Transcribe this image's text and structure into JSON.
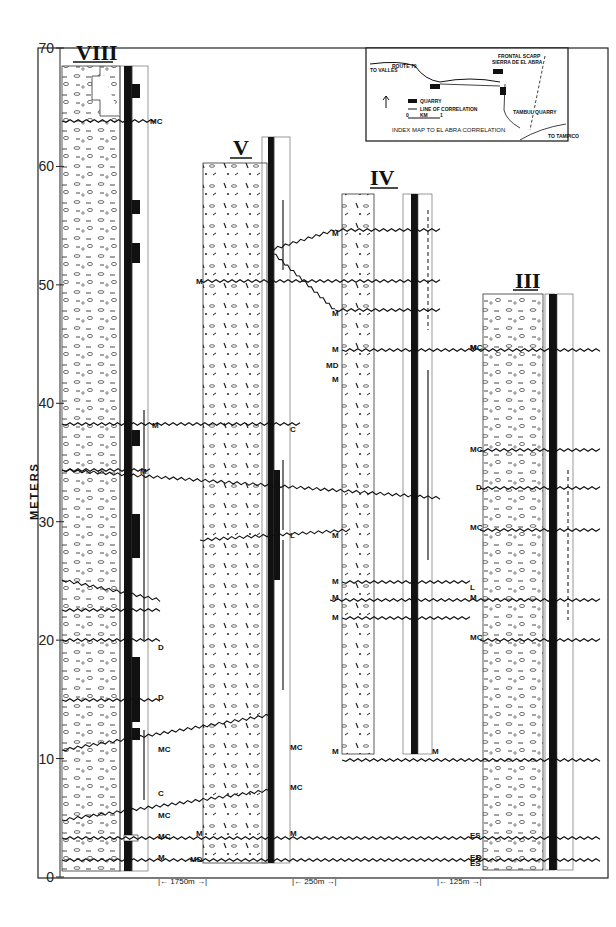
{
  "figure": {
    "y_axis": {
      "label": "METERS",
      "ticks": [
        0,
        10,
        20,
        30,
        40,
        50,
        60,
        70
      ],
      "range": [
        0,
        70
      ]
    },
    "columns": [
      {
        "id": "VIII",
        "label": "VIII",
        "top_m": 68
      },
      {
        "id": "V",
        "label": "V",
        "top_m": 60
      },
      {
        "id": "IV",
        "label": "IV",
        "top_m": 55
      },
      {
        "id": "III",
        "label": "III",
        "top_m": 49
      }
    ],
    "spacings": [
      {
        "label": "1750m",
        "between": [
          "VIII",
          "V"
        ]
      },
      {
        "label": "250m",
        "between": [
          "V",
          "IV"
        ]
      },
      {
        "label": "125m",
        "between": [
          "IV",
          "III"
        ]
      }
    ],
    "horizon_labels": {
      "VIII": [
        "MC",
        "M",
        "M",
        "D",
        "D",
        "MC",
        "C",
        "MC",
        "MC",
        "M"
      ],
      "V": [
        "M",
        "C",
        "L",
        "MC",
        "MC",
        "M",
        "M",
        "MD"
      ],
      "IV": [
        "M",
        "M",
        "M",
        "MD",
        "M",
        "M",
        "M",
        "M",
        "M",
        "M",
        "M"
      ],
      "III": [
        "MC",
        "M",
        "MC",
        "D",
        "MC",
        "MC",
        "M",
        "L",
        "ES",
        "ES",
        "D",
        "ES"
      ]
    },
    "index_map": {
      "title": "INDEX MAP TO EL ABRA CORRELATION",
      "labels": {
        "to_valles": "TO VALLES",
        "route": "ROUTE 70",
        "frontal_scarp": "FRONTAL SCARP",
        "sierra": "SIERRA DE EL ABRA",
        "quarry": "QUARRY",
        "line": "LINE OF CORRELATION",
        "km": "KM",
        "km0": "0",
        "km1": "1",
        "tambul": "TAMBUL QUARRY",
        "to_tampico": "TO TAMPICO",
        "north": "N"
      }
    }
  }
}
